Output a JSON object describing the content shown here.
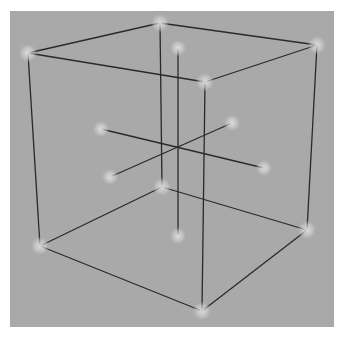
{
  "figure": {
    "type": "3d-cube-wireframe",
    "background_color": "#a9a9a9",
    "line_color": "#2a2a2a",
    "node_color": "#d8d8d8"
  },
  "cube": {
    "vertices": [
      {
        "id": "top-left",
        "x": 28,
        "y": 53
      },
      {
        "id": "top-back",
        "x": 160,
        "y": 23
      },
      {
        "id": "top-right",
        "x": 317,
        "y": 45
      },
      {
        "id": "top-front",
        "x": 205,
        "y": 82
      },
      {
        "id": "bottom-left",
        "x": 40,
        "y": 246
      },
      {
        "id": "bottom-back",
        "x": 162,
        "y": 187
      },
      {
        "id": "bottom-right",
        "x": 307,
        "y": 230
      },
      {
        "id": "bottom-front",
        "x": 202,
        "y": 311
      }
    ],
    "edges": [
      [
        "top-left",
        "top-back"
      ],
      [
        "top-back",
        "top-right"
      ],
      [
        "top-right",
        "top-front"
      ],
      [
        "top-front",
        "top-left"
      ],
      [
        "bottom-left",
        "bottom-back"
      ],
      [
        "bottom-back",
        "bottom-right"
      ],
      [
        "bottom-right",
        "bottom-front"
      ],
      [
        "bottom-front",
        "bottom-left"
      ],
      [
        "top-left",
        "bottom-left"
      ],
      [
        "top-back",
        "bottom-back"
      ],
      [
        "top-right",
        "bottom-right"
      ],
      [
        "top-front",
        "bottom-front"
      ]
    ]
  },
  "axes": {
    "center": {
      "x": 178,
      "y": 147
    },
    "nodes": [
      {
        "id": "axis-top",
        "x": 178,
        "y": 48
      },
      {
        "id": "axis-bottom",
        "x": 178,
        "y": 236
      },
      {
        "id": "axis-left",
        "x": 101,
        "y": 129
      },
      {
        "id": "axis-right",
        "x": 264,
        "y": 168
      },
      {
        "id": "axis-back",
        "x": 232,
        "y": 123
      },
      {
        "id": "axis-front",
        "x": 110,
        "y": 177
      }
    ]
  }
}
